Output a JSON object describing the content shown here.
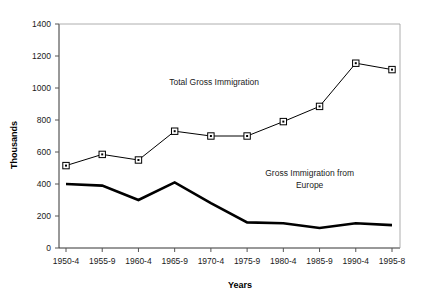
{
  "chart_data": {
    "type": "line",
    "title": "",
    "xlabel": "Years",
    "ylabel": "Thousands",
    "categories": [
      "1950-4",
      "1955-9",
      "1960-4",
      "1965-9",
      "1970-4",
      "1975-9",
      "1980-4",
      "1985-9",
      "1990-4",
      "1995-8"
    ],
    "ylim": [
      0,
      1400
    ],
    "ytick_step": 200,
    "yticks": [
      "0",
      "200",
      "400",
      "600",
      "800",
      "1000",
      "1200",
      "1400"
    ],
    "grid": false,
    "legend_position": "inline-annotations",
    "series": [
      {
        "name": "Total Gross Immigration",
        "values": [
          515,
          585,
          550,
          730,
          700,
          700,
          790,
          885,
          1155,
          1115
        ],
        "marker": "open-square",
        "color": "#000000"
      },
      {
        "name": "Gross Immigration from Europe",
        "values": [
          400,
          390,
          300,
          410,
          280,
          160,
          155,
          125,
          155,
          143
        ],
        "marker": "none",
        "color": "#000000"
      }
    ],
    "annotations": [
      {
        "text": "Total Gross Immigration",
        "x_frac": 0.455,
        "y_value": 1020
      },
      {
        "text": "Gross Immigration from",
        "x_frac": 0.735,
        "y_value": 448
      },
      {
        "text": "Europe",
        "x_frac": 0.735,
        "y_value": 378
      }
    ]
  },
  "labels": {
    "y_axis_title": "Thousands",
    "x_axis_title": "Years",
    "annotation_total": "Total Gross Immigration",
    "annotation_europe_line1": "Gross Immigration from",
    "annotation_europe_line2": "Europe"
  },
  "colors": {
    "axis": "#333333",
    "series_total": "#000000",
    "series_europe": "#000000",
    "background": "#ffffff",
    "text": "#1a1a1a"
  }
}
